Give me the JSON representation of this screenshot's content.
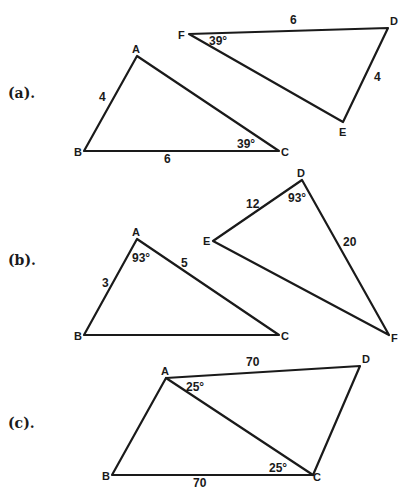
{
  "parts": [
    {
      "label": "(a).",
      "figures": [
        {
          "vertices": {
            "A": "A",
            "B": "B",
            "C": "C"
          },
          "side_labels": {
            "AB": "4",
            "BC": "6"
          },
          "angle_labels": {
            "C": "39°"
          }
        },
        {
          "vertices": {
            "F": "F",
            "D": "D",
            "E": "E"
          },
          "side_labels": {
            "FD": "6",
            "DE": "4"
          },
          "angle_labels": {
            "F": "39°"
          }
        }
      ]
    },
    {
      "label": "(b).",
      "figures": [
        {
          "vertices": {
            "A": "A",
            "B": "B",
            "C": "C"
          },
          "side_labels": {
            "AB": "3",
            "AC": "5"
          },
          "angle_labels": {
            "A": "93°"
          }
        },
        {
          "vertices": {
            "D": "D",
            "E": "E",
            "F": "F"
          },
          "side_labels": {
            "ED": "12",
            "DF": "20"
          },
          "angle_labels": {
            "D": "93°"
          }
        }
      ]
    },
    {
      "label": "(c).",
      "figures": [
        {
          "vertices": {
            "A": "A",
            "B": "B",
            "C": "C",
            "D": "D"
          },
          "side_labels": {
            "AD": "70",
            "BC": "70"
          },
          "angle_labels": {
            "DAC": "25°",
            "BCA": "25°"
          }
        }
      ]
    }
  ]
}
